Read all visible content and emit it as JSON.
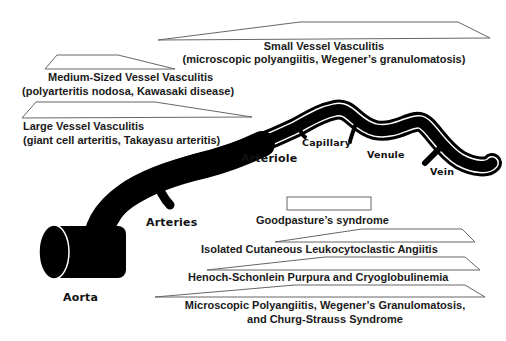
{
  "diagram": {
    "vessels": {
      "aorta": "Aorta",
      "arteries": "Arteries",
      "arteriole": "Arteriole",
      "capillary": "Capillary",
      "venule": "Venule",
      "vein": "Vein"
    },
    "top_labels": {
      "small": {
        "title": "Small Vessel Vasculitis",
        "subtitle": "(microscopic polyangiitis, Wegener’s granulomatosis)"
      },
      "medium": {
        "title": "Medium-Sized Vessel Vasculitis",
        "subtitle": "(polyarteritis nodosa, Kawasaki disease)"
      },
      "large": {
        "title": "Large Vessel Vasculitis",
        "subtitle": "(giant cell arteritis, Takayasu arteritis)"
      }
    },
    "bottom_labels": {
      "goodpasture": "Goodpasture’s syndrome",
      "isolated": "Isolated Cutaneous Leukocytoclastic Angiitis",
      "henoch": "Henoch-Schonlein Purpura and Cryoglobulinemia",
      "microscopic_line1": "Microscopic Polyangiitis, Wegener’s Granulomatosis,",
      "microscopic_line2": "and Churg-Strauss Syndrome"
    },
    "colors": {
      "vessel_fill": "#000000",
      "line": "#555555",
      "text": "#1a1a1a"
    }
  }
}
